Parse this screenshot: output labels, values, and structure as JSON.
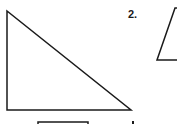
{
  "figures": [
    {
      "id": 1,
      "type": "right-triangle",
      "vertices": [
        [
          7,
          11
        ],
        [
          7,
          110
        ],
        [
          131,
          110
        ]
      ]
    },
    {
      "id": 2,
      "label": "2.",
      "type": "triangle-partial",
      "vertices": [
        [
          175,
          8
        ],
        [
          157,
          60
        ],
        [
          177,
          60
        ]
      ]
    }
  ],
  "extra_marks": {
    "bottom_rect": {
      "x": 38,
      "y": 122,
      "width": 50
    },
    "dot": {
      "x": 133,
      "y": 122
    }
  },
  "colors": {
    "stroke": "#1a1a1a",
    "background": "#ffffff"
  }
}
